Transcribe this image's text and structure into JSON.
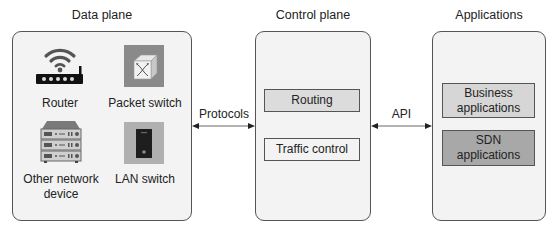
{
  "panels": {
    "data_plane": {
      "title": "Data plane",
      "devices": [
        {
          "label": "Router",
          "icon": "wifi-router-icon"
        },
        {
          "label": "Packet switch",
          "icon": "packet-switch-icon"
        },
        {
          "label_line1": "Other network",
          "label_line2": "device",
          "icon": "server-rack-icon"
        },
        {
          "label": "LAN switch",
          "icon": "lan-switch-icon"
        }
      ]
    },
    "control_plane": {
      "title": "Control plane",
      "blocks": [
        {
          "label": "Routing"
        },
        {
          "label": "Traffic control"
        }
      ]
    },
    "applications": {
      "title": "Applications",
      "blocks": [
        {
          "label_line1": "Business",
          "label_line2": "applications"
        },
        {
          "label_line1": "SDN",
          "label_line2": "applications"
        }
      ]
    }
  },
  "connectors": {
    "protocols": "Protocols",
    "api": "API"
  },
  "colors": {
    "panel_bg": "#f3f3f3",
    "border": "#555555",
    "routing_bg": "#dcdcdc",
    "business_bg": "#d6d6d6",
    "sdn_bg": "#a8a8a8"
  }
}
